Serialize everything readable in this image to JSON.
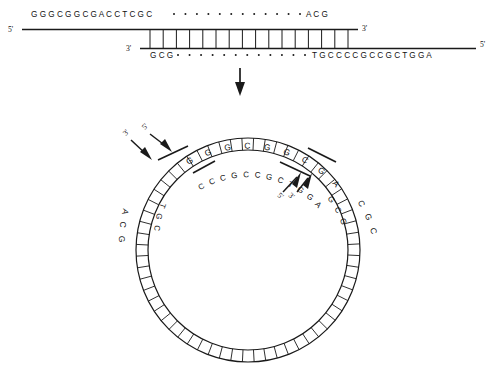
{
  "figure": {
    "background_color": "#ffffff",
    "line_color": "#1a1a1a"
  },
  "linear_duplex": {
    "top_strand": {
      "five_prime_label": "5'",
      "three_prime_label": "3'",
      "left_sequence": "G G G C G G C G A C C T C G C",
      "left_sequence_plain": "GGGCGGCGACCTCGC",
      "middle_dots_count": 12,
      "right_sequence": "A C G",
      "right_sequence_plain": "ACG"
    },
    "bottom_strand": {
      "three_prime_label": "3'",
      "five_prime_label": "5'",
      "left_sequence": "G C G",
      "left_sequence_plain": "GCG",
      "middle_dots_count": 12,
      "right_sequence": "T G C C C C G C C G C T G G A",
      "right_sequence_plain": "TGCCCCGCCGCTGGA"
    },
    "base_pair_rungs": 16
  },
  "transition": {
    "arrow_icon": "down-arrow-icon",
    "direction": "down"
  },
  "circle": {
    "outer_top_sequence": "G G G C G G C G A C C T",
    "outer_top_sequence_plain": "GGGCGGCGACCT",
    "inner_top_sequence": "C C C G C C G C T G G A",
    "inner_top_sequence_plain": "CCCGCCGCTGGA",
    "outer_left_sequence": "A C G",
    "outer_left_sequence_plain": "ACG",
    "inner_left_sequence": "T G C",
    "inner_left_sequence_plain": "TGC",
    "outer_right_sequence": "C G C",
    "outer_right_sequence_plain": "CGC",
    "inner_right_sequence": "G C G",
    "inner_right_sequence_plain": "GCG",
    "left_junction_labels": {
      "three_prime": "3'",
      "five_prime": "5'"
    },
    "right_junction_labels": {
      "five_prime": "5'",
      "three_prime": "3'"
    },
    "rung_count": 60
  }
}
